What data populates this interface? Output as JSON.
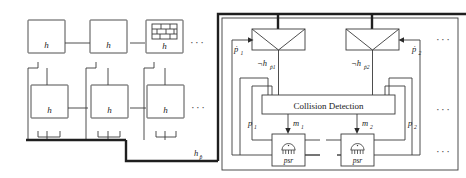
{
  "figure": {
    "background": "#ffffff",
    "stroke_color": "#3a3a3a",
    "thick_stroke_color": "#1f1f1f",
    "text_color": "#222222"
  },
  "left_panel": {
    "name": "hierarchy-network",
    "top_row": [
      {
        "label": "h",
        "kind": "plain"
      },
      {
        "label": "h",
        "kind": "plain"
      },
      {
        "label": "h",
        "kind": "brick"
      }
    ],
    "bottom_row": [
      {
        "label": "h",
        "kind": "plain"
      },
      {
        "label": "h",
        "kind": "plain"
      },
      {
        "label": "h",
        "kind": "plain"
      }
    ],
    "ellipsis_top": "···",
    "ellipsis_bottom": "···",
    "bus_label": "h",
    "bus_label_sub": "p̂"
  },
  "right_panel": {
    "name": "collision-detection-block",
    "columns": [
      {
        "id": "col1",
        "funnel_name": "funnel-1",
        "input_label": "ṗ",
        "input_sub": "1",
        "neg_label": "¬h",
        "neg_sub": "ṗ1",
        "position_label": "p",
        "position_sub": "1",
        "message_label": "m",
        "message_sub": "1",
        "sensor_label": "psr"
      },
      {
        "id": "col2",
        "funnel_name": "funnel-2",
        "input_label": "ṗ",
        "input_sub": "2",
        "neg_label": "¬h",
        "neg_sub": "ṗ2",
        "position_label": "p",
        "position_sub": "2",
        "message_label": "m",
        "message_sub": "2",
        "sensor_label": "psr"
      }
    ],
    "collision_box_label": "Collision Detection",
    "ellipsis_top": "···",
    "ellipsis_mid": "···",
    "ellipsis_bottom": "···"
  }
}
